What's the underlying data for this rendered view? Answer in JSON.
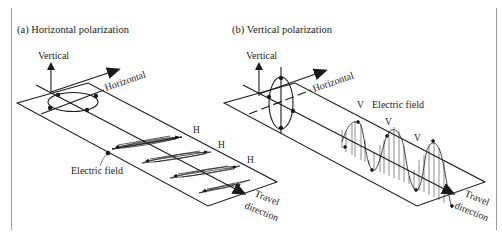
{
  "figure": {
    "panel_a": {
      "title": "(a) Horizontal polarization",
      "axis_vertical": "Vertical",
      "axis_horizontal": "Horizontal",
      "field_label": "Electric field",
      "wave_markers": [
        "H",
        "H",
        "H"
      ],
      "travel_line1": "Travel",
      "travel_line2": "direction"
    },
    "panel_b": {
      "title": "(b) Vertical polarization",
      "axis_vertical": "Vertical",
      "axis_horizontal": "Horizontal",
      "field_label": "Electric field",
      "wave_markers": [
        "V",
        "V",
        "V"
      ],
      "travel_line1": "Travel",
      "travel_line2": "direction"
    },
    "colors": {
      "line": "#1a1a1a",
      "frame": "#9a9a9a",
      "text": "#222222"
    }
  }
}
